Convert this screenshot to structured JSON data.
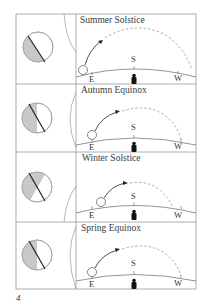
{
  "figure": {
    "page_number": "4",
    "colors": {
      "frame": "#9a9a9a",
      "shadow": "#c8c8c8",
      "axis": "#222222",
      "path_dashed": "#8a8a8a",
      "arrow": "#222222",
      "person": "#111111"
    },
    "panels": [
      {
        "title": "Summer Solstice",
        "labels": {
          "east": "E",
          "south": "S",
          "west": "W"
        },
        "globe": {
          "shadow": "left-half-tilted",
          "axis": "tilted"
        }
      },
      {
        "title": "Autumn Equinox",
        "labels": {
          "east": "E",
          "south": "S",
          "west": "W"
        },
        "globe": {
          "shadow": "left-half",
          "axis": "tilted"
        }
      },
      {
        "title": "Winter Solstice",
        "labels": {
          "east": "E",
          "south": "S",
          "west": "W"
        },
        "globe": {
          "shadow": "top-left",
          "axis": "tilted"
        }
      },
      {
        "title": "Spring Equinox",
        "labels": {
          "east": "E",
          "south": "S",
          "west": "W"
        },
        "globe": {
          "shadow": "left-half",
          "axis": "tilted"
        }
      }
    ]
  }
}
